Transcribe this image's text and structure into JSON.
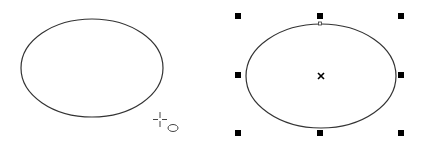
{
  "canvas": {
    "background": "#ffffff",
    "stroke_color": "#333333",
    "handle_color": "#000000"
  },
  "left_panel": {
    "description": "ellipse being drawn with ellipse tool",
    "ellipse": {
      "cx": 92,
      "cy": 68,
      "rx": 71,
      "ry": 49
    },
    "cursor": {
      "type": "ellipse-tool-cursor",
      "x": 160,
      "y": 118
    }
  },
  "right_panel": {
    "description": "selected ellipse with bounding-box handles",
    "ellipse": {
      "cx": 321,
      "cy": 76,
      "rx": 75,
      "ry": 52
    },
    "center_marker": {
      "x": 321,
      "y": 76
    },
    "node": {
      "x": 320,
      "y": 24
    },
    "handles": [
      {
        "x": 238,
        "y": 16
      },
      {
        "x": 320,
        "y": 16
      },
      {
        "x": 401,
        "y": 16
      },
      {
        "x": 238,
        "y": 75
      },
      {
        "x": 401,
        "y": 75
      },
      {
        "x": 238,
        "y": 133
      },
      {
        "x": 320,
        "y": 133
      },
      {
        "x": 401,
        "y": 133
      }
    ]
  }
}
